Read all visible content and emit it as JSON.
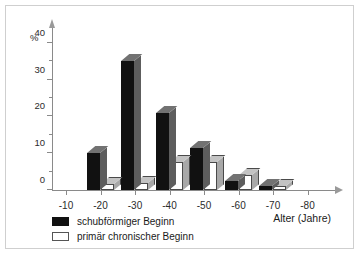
{
  "chart_data": {
    "type": "bar",
    "title": "",
    "subtitle": "",
    "xlabel": "Alter (Jahre)",
    "ylabel": "%",
    "categories": [
      "-10",
      "-20",
      "-30",
      "-40",
      "-50",
      "-60",
      "-70",
      "-80"
    ],
    "series": [
      {
        "name": "schubförmiger Beginn",
        "color": "#111111",
        "values": [
          0,
          10,
          35,
          21,
          11.5,
          2.5,
          1,
          0
        ]
      },
      {
        "name": "primär chronischer Beginn",
        "color": "#ffffff",
        "values": [
          0,
          1.5,
          2,
          7.5,
          7.5,
          4,
          1,
          0
        ]
      }
    ],
    "ylim": [
      0,
      44
    ],
    "y_major_ticks": [
      0,
      10,
      20,
      30,
      40
    ],
    "y_minor_ticks": [
      5,
      15,
      25,
      35
    ],
    "y_tick_labels": [
      "0",
      "10",
      "20",
      "30",
      "40"
    ],
    "grid": false,
    "legend_position": "bottom-left",
    "axis_arrows": true,
    "style": "3d-bars"
  },
  "axes": {
    "y_unit": "%",
    "x_title": "Alter (Jahre)"
  },
  "legend": {
    "entries": [
      {
        "label": "schubförmiger Beginn",
        "swatch": "dark"
      },
      {
        "label": "primär chronischer Beginn",
        "swatch": "light"
      }
    ]
  }
}
